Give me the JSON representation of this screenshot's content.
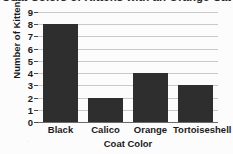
{
  "chart_data": {
    "type": "bar",
    "title": "Coat Colors of Kittens with an Orange Cat",
    "title_note": "cropped at top edge of image",
    "categories": [
      "Black",
      "Calico",
      "Orange",
      "Tortoiseshell"
    ],
    "values": [
      8,
      2,
      4,
      3
    ],
    "xlabel": "Coat Color",
    "ylabel": "Number of Kittens",
    "ylim": [
      0,
      9
    ],
    "ytick_labels": [
      "9",
      "8",
      "7",
      "6",
      "5",
      "4",
      "3",
      "2",
      "1",
      "0"
    ],
    "ytick_values": [
      9,
      8,
      7,
      6,
      5,
      4,
      3,
      2,
      1,
      0
    ],
    "grid": true,
    "grid_axis": "y",
    "legend": "none",
    "bar_color": "#2e2e2e",
    "gridline_color": "#c9c9c9",
    "axis_color": "#6b6b6b",
    "background_color": "#fcfcfc"
  }
}
